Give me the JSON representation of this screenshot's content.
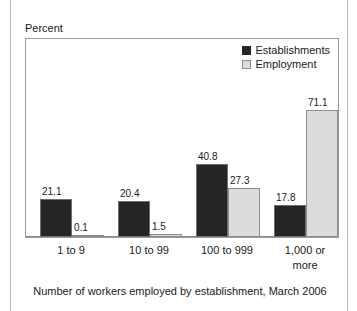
{
  "figure": {
    "y_axis_title": "Percent",
    "caption": "Number of workers employed by establishment, March 2006",
    "title_strip": ""
  },
  "legend": {
    "items": [
      {
        "label": "Establishments",
        "color": "#252525",
        "swatch": "dark"
      },
      {
        "label": "Employment",
        "color": "#dcdcdc",
        "swatch": "light"
      }
    ]
  },
  "chart_data": {
    "type": "bar",
    "title": "",
    "xlabel": "Number of workers employed by establishment, March 2006",
    "ylabel": "Percent",
    "ylim": [
      0,
      80
    ],
    "grid": false,
    "legend_position": "top-right",
    "categories": [
      "1 to 9",
      "10 to 99",
      "100 to 999",
      "1,000 or more"
    ],
    "series": [
      {
        "name": "Establishments",
        "color": "#252525",
        "values": [
          21.1,
          20.4,
          40.8,
          17.8
        ]
      },
      {
        "name": "Employment",
        "color": "#dcdcdc",
        "values": [
          0.1,
          1.5,
          27.3,
          71.1
        ]
      }
    ],
    "labels": {
      "Establishments": [
        "21.1",
        "20.4",
        "40.8",
        "17.8"
      ],
      "Employment": [
        "0.1",
        "1.5",
        "27.3",
        "71.1"
      ]
    }
  },
  "category_lines": [
    [
      "1 to 9"
    ],
    [
      "10 to 99"
    ],
    [
      "100 to 999"
    ],
    [
      "1,000 or",
      "more"
    ]
  ]
}
